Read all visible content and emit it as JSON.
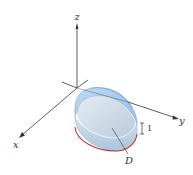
{
  "figure": {
    "axes": {
      "x_label": "x",
      "y_label": "y",
      "z_label": "z"
    },
    "annotations": {
      "region_label": "D",
      "height_label": "1"
    },
    "colors": {
      "axis": "#333333",
      "solid_fill_top": "#a9cdee",
      "solid_fill_side": "#c9dcea",
      "solid_edge": "#7fa8cc",
      "base_edge": "#c8323c",
      "background": "#ffffff"
    }
  }
}
